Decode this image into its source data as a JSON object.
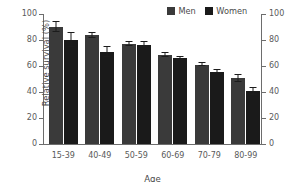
{
  "chart_data": {
    "type": "bar",
    "title": "",
    "xlabel": "Age",
    "ylabel": "Relative survival (%)",
    "ylim": [
      0,
      100
    ],
    "yticks": [
      0,
      20,
      40,
      60,
      80,
      100
    ],
    "ytick_labels": [
      "0",
      "20",
      "40",
      "60",
      "80",
      "100"
    ],
    "right_axis": {
      "ylim": [
        0,
        100
      ],
      "yticks": [
        0,
        20,
        40,
        60,
        80,
        100
      ],
      "ytick_labels": [
        "0",
        "20",
        "40",
        "60",
        "80",
        "100"
      ]
    },
    "grid": false,
    "legend_position": "top-right",
    "categories": [
      "15-39",
      "40-49",
      "50-59",
      "60-69",
      "70-79",
      "80-99"
    ],
    "series": [
      {
        "name": "Men",
        "color": "#3a3a3a",
        "values": [
          90.0,
          83.5,
          77.0,
          68.5,
          61.0,
          50.5
        ],
        "errors": [
          3.5,
          2.0,
          1.8,
          1.2,
          1.2,
          2.5
        ]
      },
      {
        "name": "Women",
        "color": "#1a1a1a",
        "values": [
          80.0,
          71.0,
          76.5,
          66.0,
          55.5,
          40.5
        ],
        "errors": [
          5.5,
          4.0,
          1.8,
          1.2,
          1.2,
          2.5
        ]
      }
    ]
  },
  "legend": {
    "entries": [
      {
        "label": "Men",
        "color": "#3a3a3a"
      },
      {
        "label": "Women",
        "color": "#1a1a1a"
      }
    ]
  },
  "title_sliver": {
    "text": ""
  }
}
